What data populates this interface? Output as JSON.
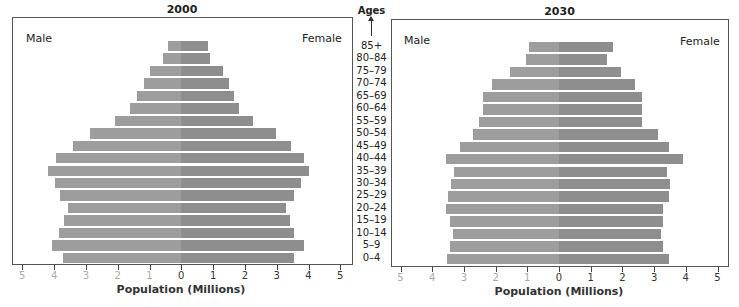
{
  "chart_data": [
    {
      "type": "bar",
      "orientation": "horizontal-pyramid",
      "title": "2000",
      "xlabel": "Population (Millions)",
      "ylabel": "Ages",
      "xlim": [
        -5,
        5
      ],
      "xticks": [
        5,
        4,
        3,
        2,
        1,
        0,
        1,
        2,
        3,
        4,
        5
      ],
      "legend": [
        "Male",
        "Female"
      ],
      "categories": [
        "85+",
        "80–84",
        "75–79",
        "70–74",
        "65–69",
        "60–64",
        "55–59",
        "50–54",
        "45–49",
        "40–44",
        "35–39",
        "30–34",
        "25–29",
        "20–24",
        "15–19",
        "10–14",
        "5–9",
        "0–4"
      ],
      "series": [
        {
          "name": "Male",
          "values": [
            0.42,
            0.59,
            1.0,
            1.16,
            1.4,
            1.62,
            2.09,
            2.86,
            3.4,
            3.93,
            4.18,
            3.98,
            3.8,
            3.57,
            3.7,
            3.84,
            4.07,
            3.72
          ]
        },
        {
          "name": "Female",
          "values": [
            0.84,
            0.91,
            1.31,
            1.51,
            1.65,
            1.8,
            2.24,
            2.99,
            3.44,
            3.86,
            4.02,
            3.75,
            3.55,
            3.28,
            3.41,
            3.55,
            3.85,
            3.55
          ]
        }
      ]
    },
    {
      "type": "bar",
      "orientation": "horizontal-pyramid",
      "title": "2030",
      "xlabel": "Population (Millions)",
      "ylabel": "Ages",
      "xlim": [
        -5,
        5
      ],
      "xticks": [
        5,
        4,
        3,
        2,
        1,
        0,
        1,
        2,
        3,
        4,
        5
      ],
      "legend": [
        "Male",
        "Female"
      ],
      "categories": [
        "85+",
        "80–84",
        "75–79",
        "70–74",
        "65–69",
        "60–64",
        "55–59",
        "50–54",
        "45–49",
        "40–44",
        "35–39",
        "30–34",
        "25–29",
        "20–24",
        "15–19",
        "10–14",
        "5–9",
        "0–4"
      ],
      "series": [
        {
          "name": "Male",
          "values": [
            0.95,
            1.04,
            1.55,
            2.1,
            2.4,
            2.4,
            2.51,
            2.7,
            3.11,
            3.57,
            3.32,
            3.41,
            3.51,
            3.56,
            3.44,
            3.35,
            3.44,
            3.54
          ]
        },
        {
          "name": "Female",
          "values": [
            1.69,
            1.5,
            1.96,
            2.41,
            2.61,
            2.61,
            2.61,
            3.13,
            3.48,
            3.9,
            3.41,
            3.5,
            3.46,
            3.28,
            3.28,
            3.21,
            3.27,
            3.47
          ]
        }
      ]
    }
  ],
  "labels": {
    "ages_title": "Ages",
    "male": "Male",
    "female": "Female",
    "xlabel": "Population (Millions)",
    "left_title": "2000",
    "right_title": "2030"
  },
  "colors": {
    "male": "#9d9d9d",
    "female": "#8e8e8e",
    "frame": "#555555",
    "neg_tick_label": "#aaaaaa",
    "pos_tick_label": "#333333"
  }
}
